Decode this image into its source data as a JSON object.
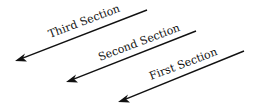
{
  "diagram": {
    "arrows": [
      {
        "label": "Third Section",
        "x1": 147,
        "y1": 10,
        "x2": 15,
        "y2": 61
      },
      {
        "label": "Second Section",
        "x1": 196,
        "y1": 31,
        "x2": 66,
        "y2": 82
      },
      {
        "label": "First Section",
        "x1": 244,
        "y1": 51,
        "x2": 118,
        "y2": 102
      }
    ],
    "color": "#111111"
  }
}
